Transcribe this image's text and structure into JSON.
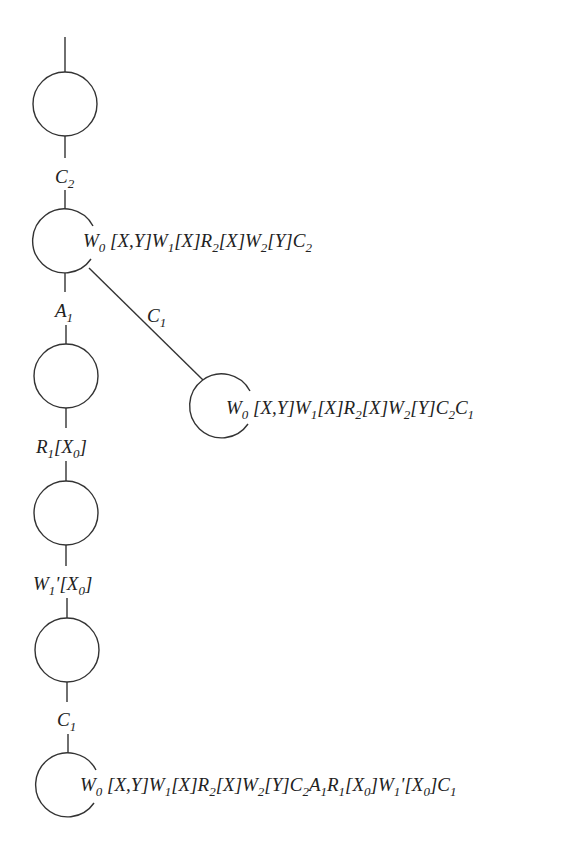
{
  "diagram": {
    "type": "transaction-history-tree",
    "nodes": [
      {
        "id": "n0",
        "cx": 65,
        "cy": 104,
        "r": 32,
        "open": false,
        "label": ""
      },
      {
        "id": "n1",
        "cx": 65,
        "cy": 241,
        "r": 32,
        "open": true,
        "label": "W0 [X,Y]W1[X]R2[X]W2[Y]C2"
      },
      {
        "id": "n2",
        "cx": 66,
        "cy": 376,
        "r": 32,
        "open": false,
        "label": ""
      },
      {
        "id": "n3",
        "cx": 66,
        "cy": 513,
        "r": 32,
        "open": false,
        "label": ""
      },
      {
        "id": "n4",
        "cx": 67,
        "cy": 650,
        "r": 32,
        "open": false,
        "label": ""
      },
      {
        "id": "n5",
        "cx": 68,
        "cy": 785,
        "r": 32,
        "open": true,
        "label": "W0 [X,Y]W1[X]R2[X]W2[Y]C2A1R1[X0]W1'[X0]C1"
      },
      {
        "id": "b1",
        "cx": 222,
        "cy": 406,
        "r": 32,
        "open": true,
        "label": "W0 [X,Y]W1[X]R2[X]W2[Y]C2C1"
      }
    ],
    "edges": [
      {
        "from": "root",
        "to": "n0",
        "label": ""
      },
      {
        "from": "n0",
        "to": "n1",
        "label": "C2"
      },
      {
        "from": "n1",
        "to": "n2",
        "label": "A1"
      },
      {
        "from": "n1",
        "to": "b1",
        "label": "C1"
      },
      {
        "from": "n2",
        "to": "n3",
        "label": "R1[X0]"
      },
      {
        "from": "n3",
        "to": "n4",
        "label": "W1'[X0]"
      },
      {
        "from": "n4",
        "to": "n5",
        "label": "C1"
      }
    ]
  }
}
